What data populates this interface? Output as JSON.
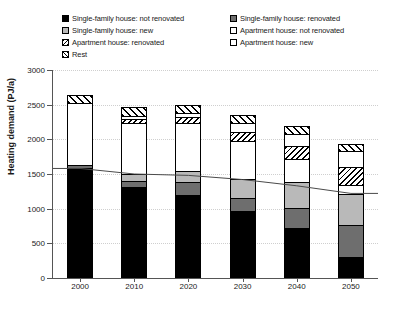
{
  "chart_data": {
    "type": "bar",
    "stacked": true,
    "title": "",
    "xlabel": "",
    "ylabel": "Heating demand (PJ/a)",
    "ylim": [
      0,
      3000
    ],
    "yticks": [
      0,
      500,
      1000,
      1500,
      2000,
      2500,
      3000
    ],
    "grid": true,
    "legend_position": "top",
    "categories": [
      "2000",
      "2010",
      "2020",
      "2030",
      "2040",
      "2050"
    ],
    "series": [
      {
        "name": "Single-family house: not renovated",
        "fill": "black",
        "values": [
          1580,
          1310,
          1200,
          960,
          720,
          310
        ]
      },
      {
        "name": "Single-family house: renovated",
        "fill": "dark-gray",
        "values": [
          45,
          90,
          180,
          200,
          290,
          450
        ]
      },
      {
        "name": "Single-family house: new",
        "fill": "light-gray",
        "values": [
          0,
          100,
          170,
          270,
          370,
          450
        ]
      },
      {
        "name": "Apartment house: not renovated",
        "fill": "white",
        "values": [
          900,
          740,
          680,
          550,
          340,
          130
        ]
      },
      {
        "name": "Apartment house: renovated",
        "fill": "diagonal-hatch",
        "values": [
          0,
          60,
          90,
          120,
          180,
          260
        ]
      },
      {
        "name": "Apartment house: new",
        "fill": "dotted",
        "values": [
          0,
          40,
          60,
          130,
          180,
          230
        ]
      },
      {
        "name": "Rest",
        "fill": "cross-hatch",
        "values": [
          120,
          125,
          120,
          120,
          110,
          100
        ]
      }
    ],
    "totals": [
      2645,
      2465,
      2500,
      2350,
      2190,
      1930
    ],
    "line_series": {
      "name": "trend",
      "values": [
        1580,
        1500,
        1480,
        1420,
        1330,
        1220
      ]
    }
  },
  "legend": {
    "left_column": [
      {
        "label": "Single-family house: not renovated",
        "swatch": "black-swatch-icon"
      },
      {
        "label": "Single-family house: new",
        "swatch": "light-gray-swatch-icon"
      },
      {
        "label": "Apartment house: renovated",
        "swatch": "hatch-swatch-icon"
      },
      {
        "label": "Rest",
        "swatch": "cross-hatch-swatch-icon"
      }
    ],
    "right_column": [
      {
        "label": "Single-family house: renovated",
        "swatch": "dark-gray-swatch-icon"
      },
      {
        "label": "Apartment house: not renovated",
        "swatch": "white-swatch-icon"
      },
      {
        "label": "Apartment house: new",
        "swatch": "white-swatch-icon"
      }
    ]
  },
  "axes": {
    "y_title": "Heating demand (PJ/a)",
    "y_tick_labels": [
      "3000",
      "2500",
      "2000",
      "1500",
      "1000",
      "500",
      "0"
    ],
    "x_tick_labels": [
      "2000",
      "2010",
      "2020",
      "2030",
      "2040",
      "2050"
    ]
  },
  "colors": {
    "black": "#000000",
    "dark_gray": "#6e6e6e",
    "light_gray": "#b9b9b9",
    "white": "#ffffff",
    "axis": "#555555",
    "grid": "#cfcfcf"
  }
}
